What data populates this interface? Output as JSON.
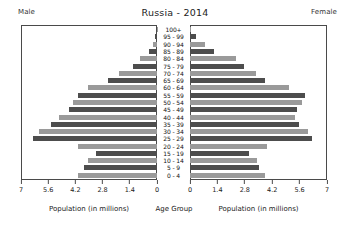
{
  "header": {
    "title": "Russia - 2014",
    "male_label": "Male",
    "female_label": "Female"
  },
  "captions": {
    "left": "Population (in millions)",
    "center": "Age Group",
    "right": "Population (in millions)"
  },
  "axis": {
    "left_ticks": [
      "7",
      "5.6",
      "4.2",
      "2.8",
      "1.4",
      "0"
    ],
    "right_ticks": [
      "0",
      "1.4",
      "2.8",
      "4.2",
      "5.6",
      "7"
    ],
    "max": 7,
    "tick_values": [
      0,
      1.4,
      2.8,
      4.2,
      5.6,
      7
    ]
  },
  "chart_data": {
    "type": "bar",
    "subtype": "population-pyramid",
    "title": "Russia - 2014",
    "xlabel": "Population (in millions)",
    "ylabel": "Age Group",
    "xlim": [
      0,
      7
    ],
    "grid": false,
    "orientation": "horizontal",
    "categories": [
      "100+",
      "95 - 99",
      "90 - 94",
      "85 - 89",
      "80 - 84",
      "75 - 79",
      "70 - 74",
      "65 - 69",
      "60 - 64",
      "55 - 59",
      "50 - 54",
      "45 - 49",
      "40 - 44",
      "35 - 39",
      "30 - 34",
      "25 - 29",
      "20 - 24",
      "15 - 19",
      "10 - 14",
      "5 - 9",
      "0 - 4"
    ],
    "series": [
      {
        "name": "Male",
        "side": "left",
        "color": "#4d4d4d",
        "values": [
          0.02,
          0.08,
          0.22,
          0.42,
          0.86,
          1.22,
          1.95,
          2.52,
          3.55,
          4.05,
          4.35,
          4.55,
          5.05,
          5.45,
          6.05,
          6.4,
          4.05,
          3.15,
          3.55,
          3.75,
          4.05
        ]
      },
      {
        "name": "Female",
        "side": "right",
        "color": "#9a9a9a",
        "values": [
          0.05,
          0.3,
          0.75,
          1.25,
          2.35,
          2.75,
          3.35,
          3.85,
          5.05,
          5.9,
          5.7,
          5.45,
          5.35,
          5.55,
          6.05,
          6.25,
          3.95,
          3.0,
          3.4,
          3.55,
          3.85
        ]
      }
    ],
    "legend": [
      "Male",
      "Female"
    ],
    "legend_position": "top-corners"
  },
  "colors": {
    "bar_dark": "#4d4d4d",
    "bar_light": "#9a9a9a",
    "axis": "#4a4a4a",
    "background": "#ffffff"
  }
}
